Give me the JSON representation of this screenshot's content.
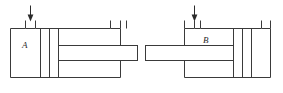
{
  "diagram": {
    "stroke_color": "#3a3a3a",
    "arrow_color": "#2b2b2b",
    "background_color": "#ffffff",
    "figures": [
      {
        "id": "figure-a",
        "chamber_label": "A",
        "rod_side": "right",
        "inlet_arrow_label": "",
        "port_count": 2
      },
      {
        "id": "figure-b",
        "chamber_label": "B",
        "rod_side": "left",
        "inlet_arrow_label": "",
        "port_count": 2
      }
    ]
  }
}
